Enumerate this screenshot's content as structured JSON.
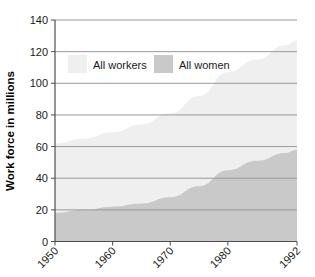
{
  "chart_data": {
    "type": "area",
    "title": "",
    "subtitle": "",
    "xlabel": "",
    "ylabel": "Work force in millions",
    "stacked": true,
    "grid": true,
    "legend_position": "inside-top-left",
    "xlim": [
      1950,
      1992
    ],
    "ylim": [
      0,
      140
    ],
    "yticks": [
      0,
      20,
      40,
      60,
      80,
      100,
      120,
      140
    ],
    "ytick_labels": [
      "0",
      "20",
      "40",
      "60",
      "80",
      "100",
      "120",
      "140"
    ],
    "xticks": [
      1950,
      1960,
      1970,
      1980,
      1992
    ],
    "xtick_labels": [
      "1950",
      "1960",
      "1970",
      "1980",
      "1992"
    ],
    "x": [
      1950,
      1955,
      1960,
      1965,
      1970,
      1975,
      1980,
      1985,
      1990,
      1992
    ],
    "series": [
      {
        "name": "All workers",
        "color": "#efefef",
        "values": [
          62,
          65,
          69,
          74,
          81,
          92,
          107,
          115,
          124,
          127
        ]
      },
      {
        "name": "All women",
        "color": "#c9c9c9",
        "values": [
          18,
          20,
          22,
          24,
          28,
          35,
          45,
          51,
          56,
          58
        ]
      }
    ],
    "annotations": []
  },
  "legend": {
    "items": [
      {
        "label": "All workers",
        "swatch_color": "#efefef"
      },
      {
        "label": "All women",
        "swatch_color": "#c9c9c9"
      }
    ]
  },
  "colors": {
    "background": "#ffffff",
    "gridline": "#9a9a9a",
    "axis": "#4d4d4d",
    "text": "#1a1a1a",
    "all_workers": "#efefef",
    "all_women": "#c9c9c9"
  }
}
